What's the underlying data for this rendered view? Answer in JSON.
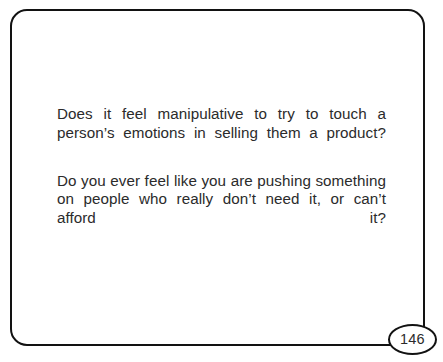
{
  "slide": {
    "page_number": "146",
    "border_color": "#121212",
    "text_color": "#2b2b2b",
    "background_color": "#ffffff",
    "paragraphs": [
      "Does it feel manipulative to try to touch a person’s emotions in selling them a product?",
      "Do you ever feel like you are pushing something on people who really don’t need it, or can’t afford it?"
    ]
  }
}
